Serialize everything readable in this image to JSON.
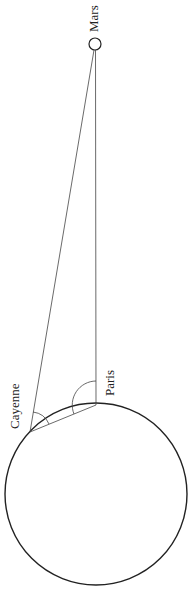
{
  "diagram": {
    "type": "parallax-geometry",
    "labels": {
      "mars": "Mars",
      "paris": "Paris",
      "cayenne": "Cayenne"
    },
    "bodies": {
      "earth": {
        "cx": 96,
        "cy": 494,
        "r": 91
      },
      "mars": {
        "cx": 95,
        "cy": 44,
        "r": 6
      }
    },
    "points": {
      "paris": {
        "x": 96,
        "y": 405
      },
      "cayenne": {
        "x": 30,
        "y": 432
      }
    },
    "colors": {
      "stroke": "#222222",
      "thin_stroke": "#444444",
      "background": "#ffffff"
    }
  }
}
